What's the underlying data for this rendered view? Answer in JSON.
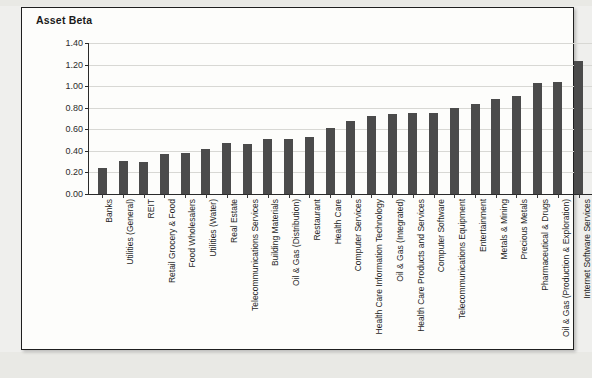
{
  "chart": {
    "title": "Asset Beta"
  },
  "chart_data": {
    "type": "bar",
    "title": "Asset Beta",
    "xlabel": "",
    "ylabel": "",
    "ylim": [
      0.0,
      1.4
    ],
    "ytick_labels": [
      "1.40",
      "1.20",
      "1.00",
      "0.80",
      "0.60",
      "0.40",
      "0.20",
      "0.00"
    ],
    "ytick_values": [
      1.4,
      1.2,
      1.0,
      0.8,
      0.6,
      0.4,
      0.2,
      0.0
    ],
    "grid": true,
    "legend": "none",
    "bar_color": "#4b4b4b",
    "categories": [
      "Banks",
      "Utilities (General)",
      "REIT",
      "Retail Grocery & Food",
      "Food Wholesalers",
      "Utilities (Water)",
      "Real Estate",
      "Telecommunications Services",
      "Building Materials",
      "Oil & Gas (Distribution)",
      "Restaurant",
      "Health Care",
      "Computer Services",
      "Health Care Information Technology",
      "Oil & Gas (Integrated)",
      "Health Care Products and Services",
      "Computer Software",
      "Telecommunications Equipment",
      "Entertainment",
      "Metals & Mining",
      "Precious Metals",
      "Pharmaceutical & Drugs",
      "Oil & Gas (Production & Exploration)",
      "Internet Software Services"
    ],
    "values": [
      0.24,
      0.31,
      0.3,
      0.37,
      0.38,
      0.42,
      0.47,
      0.46,
      0.51,
      0.51,
      0.53,
      0.61,
      0.68,
      0.72,
      0.74,
      0.75,
      0.75,
      0.8,
      0.83,
      0.88,
      0.91,
      1.03,
      1.04,
      1.23
    ]
  }
}
